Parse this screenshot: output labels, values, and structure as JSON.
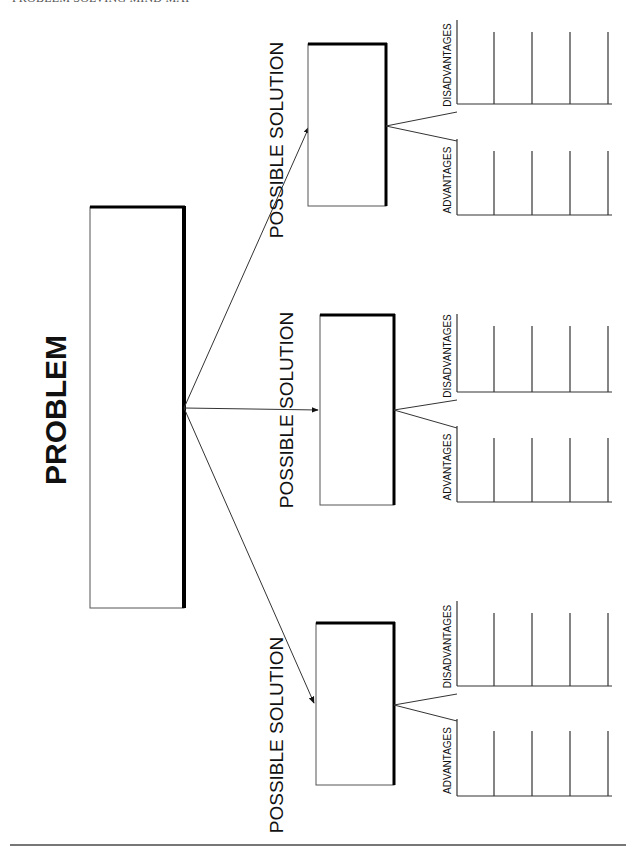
{
  "header": {
    "title": "PROBLEM SOLVING MIND MAP"
  },
  "problem": {
    "label": "PROBLEM"
  },
  "solutions": [
    {
      "label": "POSSIBLE SOLUTION",
      "advantages_label": "ADVANTAGES",
      "disadvantages_label": "DISADVANTAGES"
    },
    {
      "label": "POSSIBLE SOLUTION",
      "advantages_label": "ADVANTAGES",
      "disadvantages_label": "DISADVANTAGES"
    },
    {
      "label": "POSSIBLE SOLUTION",
      "advantages_label": "ADVANTAGES",
      "disadvantages_label": "DISADVANTAGES"
    }
  ],
  "colors": {
    "line": "#222222",
    "heavy": "#000000"
  }
}
